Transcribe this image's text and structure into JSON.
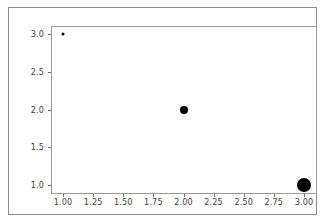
{
  "chart_data": {
    "type": "scatter",
    "title": "",
    "xlabel": "",
    "ylabel": "",
    "xlim": [
      0.9,
      3.1
    ],
    "ylim": [
      0.9,
      3.1
    ],
    "grid": false,
    "legend": null,
    "background_color": "#ffffff",
    "marker_color": "#000000",
    "frame_color": "#9a9a9a",
    "x": [
      1.0,
      2.0,
      3.0
    ],
    "y": [
      3.0,
      2.0,
      1.0
    ],
    "sizes": [
      3,
      8,
      14
    ],
    "points": [
      {
        "x": 1.0,
        "y": 3.0,
        "size": 3,
        "label": "(1.00, 3.00)"
      },
      {
        "x": 2.0,
        "y": 2.0,
        "size": 8,
        "label": "(2.00, 2.00)"
      },
      {
        "x": 3.0,
        "y": 1.0,
        "size": 14,
        "label": "(3.00, 1.00)"
      }
    ],
    "xticks": [
      1.0,
      1.25,
      1.5,
      1.75,
      2.0,
      2.25,
      2.5,
      2.75,
      3.0
    ],
    "xticklabels": [
      "1.00",
      "1.25",
      "1.50",
      "1.75",
      "2.00",
      "2.25",
      "2.50",
      "2.75",
      "3.00"
    ],
    "yticks": [
      1.0,
      1.5,
      2.0,
      2.5,
      3.0
    ],
    "yticklabels": [
      "1.0",
      "1.5",
      "2.0",
      "2.5",
      "3.0"
    ]
  }
}
